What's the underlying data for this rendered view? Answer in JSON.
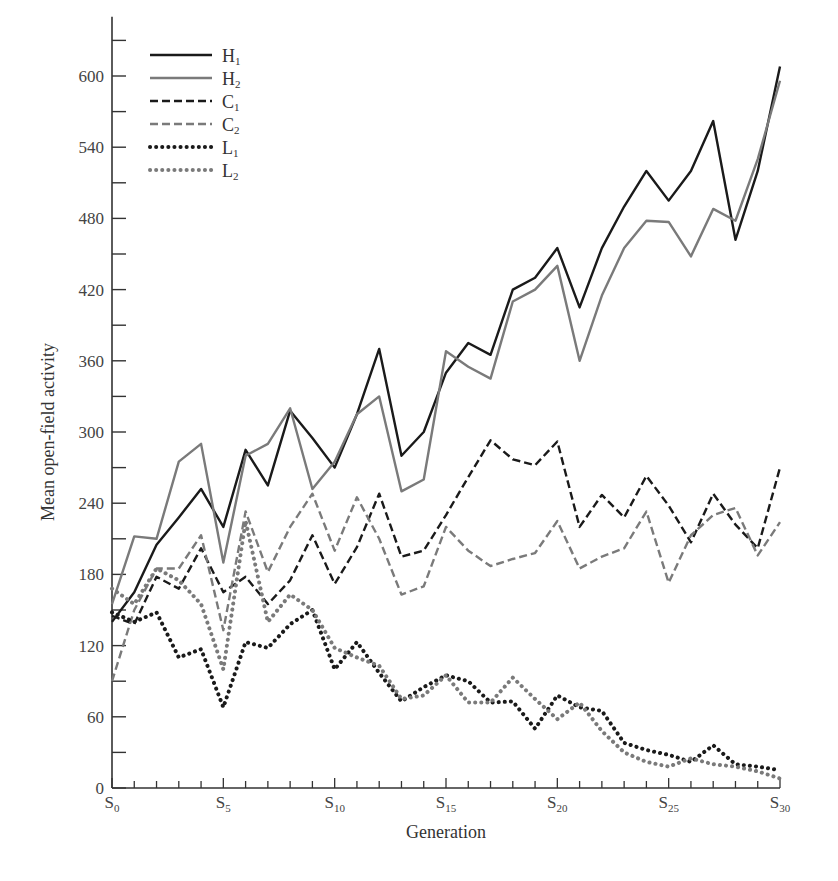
{
  "chart_data": {
    "type": "line",
    "title": "",
    "xlabel": "Generation",
    "ylabel": "Mean open-field activity",
    "ylim": [
      0,
      650
    ],
    "xlim": [
      0,
      30
    ],
    "grid": false,
    "legend_position": "upper-left",
    "y_ticks": [
      0,
      60,
      120,
      180,
      240,
      300,
      360,
      420,
      480,
      540,
      600
    ],
    "y_minor_ticks": [
      30,
      90,
      150,
      210,
      270,
      330,
      390,
      450,
      510,
      570,
      630
    ],
    "x_tick_labels": [
      {
        "x": 0,
        "main": "S",
        "sub": "0"
      },
      {
        "x": 5,
        "main": "S",
        "sub": "5"
      },
      {
        "x": 10,
        "main": "S",
        "sub": "10"
      },
      {
        "x": 15,
        "main": "S",
        "sub": "15"
      },
      {
        "x": 20,
        "main": "S",
        "sub": "20"
      },
      {
        "x": 25,
        "main": "S",
        "sub": "25"
      },
      {
        "x": 30,
        "main": "S",
        "sub": "30"
      }
    ],
    "x": [
      0,
      1,
      2,
      3,
      4,
      5,
      6,
      7,
      8,
      9,
      10,
      11,
      12,
      13,
      14,
      15,
      16,
      17,
      18,
      19,
      20,
      21,
      22,
      23,
      24,
      25,
      26,
      27,
      28,
      29,
      30
    ],
    "series": [
      {
        "name": "H1",
        "label_main": "H",
        "label_sub": "1",
        "color": "#1a1a1a",
        "dash": "solid",
        "values": [
          140,
          165,
          205,
          228,
          252,
          220,
          285,
          255,
          318,
          295,
          270,
          315,
          370,
          280,
          300,
          350,
          375,
          365,
          420,
          430,
          455,
          405,
          455,
          490,
          520,
          495,
          520,
          562,
          462,
          520,
          608
        ]
      },
      {
        "name": "H2",
        "label_main": "H",
        "label_sub": "2",
        "color": "#7a7a7a",
        "dash": "solid",
        "values": [
          155,
          212,
          210,
          275,
          290,
          190,
          280,
          290,
          320,
          252,
          275,
          315,
          330,
          250,
          260,
          368,
          355,
          345,
          410,
          420,
          440,
          360,
          415,
          455,
          478,
          477,
          448,
          488,
          478,
          530,
          596
        ]
      },
      {
        "name": "C1",
        "label_main": "C",
        "label_sub": "1",
        "color": "#1a1a1a",
        "dash": "dashed",
        "values": [
          145,
          138,
          178,
          168,
          202,
          165,
          178,
          155,
          175,
          213,
          172,
          203,
          248,
          195,
          200,
          230,
          262,
          293,
          277,
          272,
          292,
          220,
          247,
          228,
          263,
          238,
          207,
          248,
          222,
          202,
          270
        ]
      },
      {
        "name": "C2",
        "label_main": "C",
        "label_sub": "2",
        "color": "#7a7a7a",
        "dash": "dashed",
        "values": [
          90,
          150,
          185,
          185,
          213,
          133,
          233,
          182,
          220,
          248,
          200,
          245,
          210,
          163,
          170,
          220,
          200,
          187,
          193,
          198,
          225,
          185,
          195,
          202,
          233,
          173,
          213,
          230,
          236,
          196,
          224
        ]
      },
      {
        "name": "L1",
        "label_main": "L",
        "label_sub": "1",
        "color": "#1a1a1a",
        "dash": "dotted",
        "values": [
          148,
          140,
          148,
          110,
          117,
          68,
          123,
          118,
          138,
          150,
          100,
          123,
          97,
          73,
          85,
          95,
          90,
          72,
          73,
          50,
          78,
          68,
          65,
          38,
          32,
          28,
          22,
          36,
          20,
          18,
          15
        ]
      },
      {
        "name": "L2",
        "label_main": "L",
        "label_sub": "2",
        "color": "#7a7a7a",
        "dash": "dotted",
        "values": [
          168,
          155,
          185,
          175,
          155,
          100,
          225,
          140,
          163,
          150,
          118,
          110,
          103,
          75,
          78,
          95,
          72,
          72,
          93,
          75,
          58,
          72,
          48,
          30,
          22,
          18,
          25,
          20,
          18,
          14,
          8
        ]
      }
    ]
  }
}
